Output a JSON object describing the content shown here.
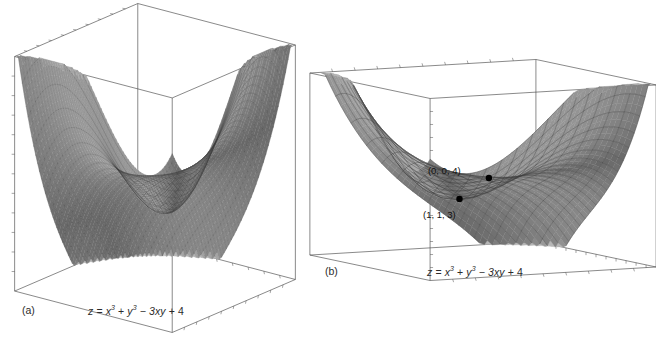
{
  "figure": {
    "background": "#ffffff",
    "ink": "#4a4a4a",
    "surface_fill": "#9a9a9a",
    "surface_fill_light": "#b9b9b9",
    "surface_fill_dark": "#7d7d7d",
    "mesh_color": "#3c3c3c"
  },
  "panels": [
    {
      "id": "a",
      "label": "(a)",
      "caption_parts": {
        "lhs": "z",
        "eq": "=",
        "x3": "x",
        "x3_exp": "3",
        "plus1": "+",
        "y3": "y",
        "y3_exp": "3",
        "minus": "−",
        "term3": "3xy",
        "plus2": "+",
        "const": "4"
      },
      "caption_plain": "z = x³ + y³ − 3xy + 4",
      "view": {
        "elev": 16,
        "azim": 38,
        "scale": 1.0
      },
      "mesh": {
        "u_lines": 60,
        "v_lines": 22,
        "style": "fine-vertical"
      },
      "domain": {
        "xmin": -2.2,
        "xmax": 2.2,
        "ymin": -2.2,
        "ymax": 2.2
      },
      "zrange": [
        -6,
        16
      ],
      "points": []
    },
    {
      "id": "b",
      "label": "(b)",
      "caption_parts": {
        "lhs": "z",
        "eq": "=",
        "x3": "x",
        "x3_exp": "3",
        "plus1": "+",
        "y3": "y",
        "y3_exp": "3",
        "minus": "−",
        "term3": "3xy",
        "plus2": "+",
        "const": "4"
      },
      "caption_plain": "z = x³ + y³ − 3xy + 4",
      "view": {
        "elev": 9,
        "azim": 62,
        "scale": 1.0
      },
      "mesh": {
        "u_lines": 22,
        "v_lines": 18,
        "style": "coarse-grid"
      },
      "domain": {
        "xmin": -1.6,
        "xmax": 2.0,
        "ymin": -1.6,
        "ymax": 2.0
      },
      "zrange": [
        -4,
        14
      ],
      "points": [
        {
          "name": "saddle-point",
          "label": "(0, 0, 4)",
          "x": 0,
          "y": 0,
          "z": 4,
          "label_dx": -34,
          "label_dy": -13
        },
        {
          "name": "local-minimum",
          "label": "(1, 1, 3)",
          "x": 1,
          "y": 1,
          "z": 3,
          "label_dx": -20,
          "label_dy": 10
        }
      ]
    }
  ],
  "chart_data": {
    "type": "surface",
    "title": "",
    "function": "z = x^3 + y^3 - 3xy + 4",
    "xlabel": "x",
    "ylabel": "y",
    "zlabel": "z",
    "series": [
      {
        "name": "panel-a-surface",
        "function": "z = x^3 + y^3 - 3xy + 4",
        "xlim": [
          -2.2,
          2.2
        ],
        "ylim": [
          -2.2,
          2.2
        ],
        "zlim": [
          -6,
          16
        ],
        "grid": true
      },
      {
        "name": "panel-b-surface",
        "function": "z = x^3 + y^3 - 3xy + 4",
        "xlim": [
          -1.6,
          2.0
        ],
        "ylim": [
          -1.6,
          2.0
        ],
        "zlim": [
          -4,
          14
        ],
        "grid": true
      }
    ],
    "annotations": [
      {
        "text": "(0, 0, 4)",
        "x": 0,
        "y": 0,
        "z": 4,
        "kind": "saddle point"
      },
      {
        "text": "(1, 1, 3)",
        "x": 1,
        "y": 1,
        "z": 3,
        "kind": "local minimum"
      }
    ],
    "legend": null,
    "axis_ticks": "unlabeled tick marks on bounding box edges"
  }
}
